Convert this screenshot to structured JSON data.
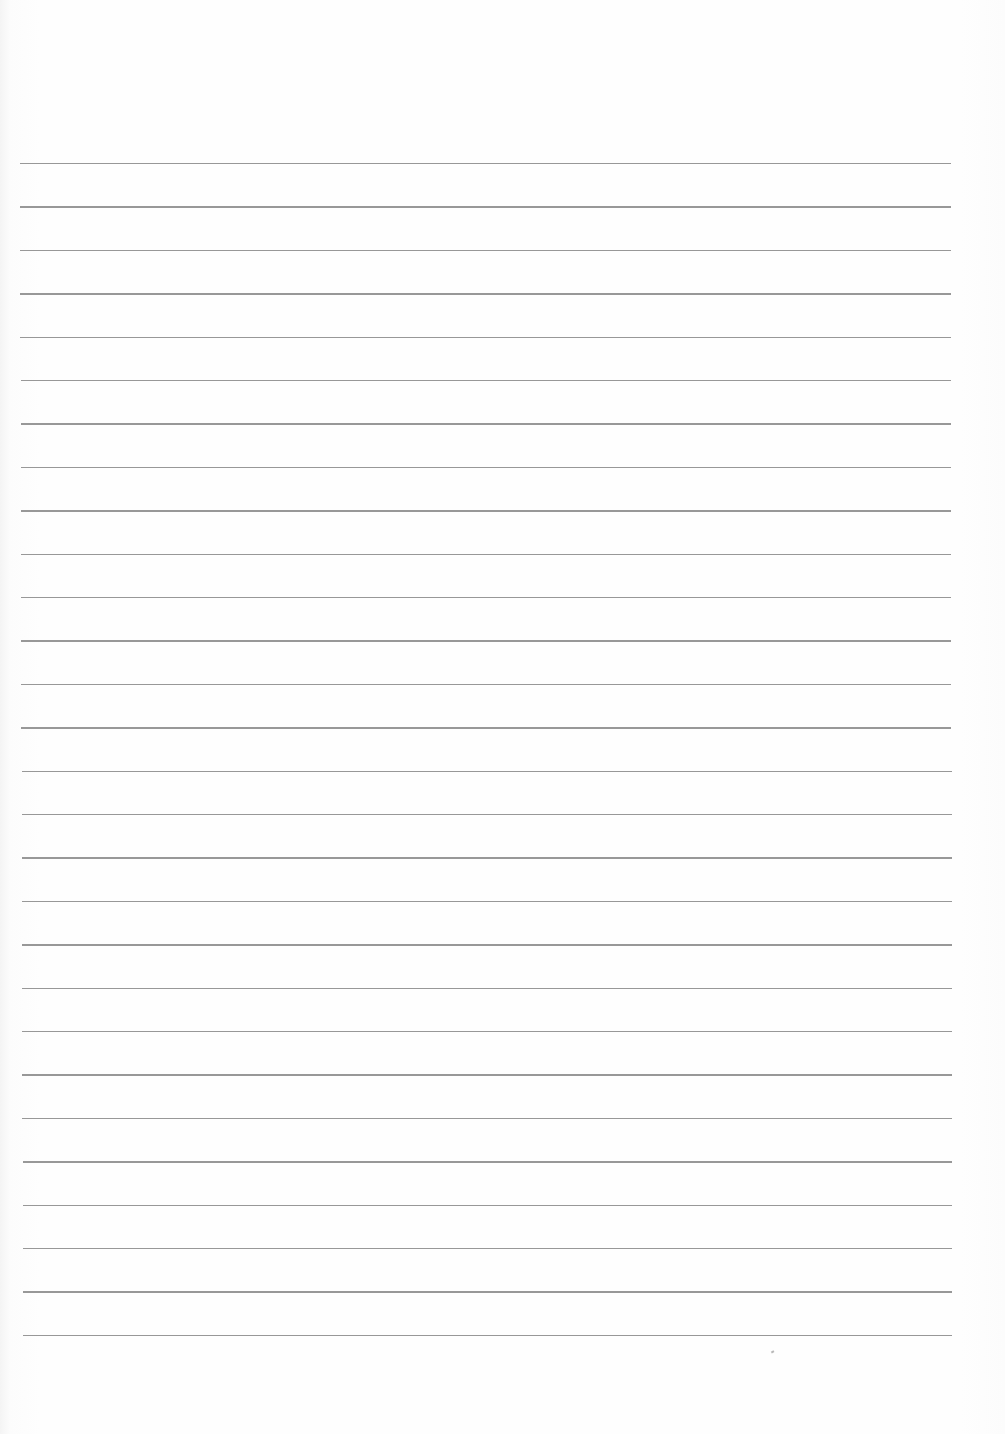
{
  "page": {
    "type": "lined-paper",
    "background_color": "#fdfdfd",
    "line_color": "#8d8d8d",
    "line_count": 28,
    "first_line_y": 163,
    "line_spacing": 43.4,
    "line_left_x": 20,
    "line_right_x": 951,
    "text_content": ""
  }
}
